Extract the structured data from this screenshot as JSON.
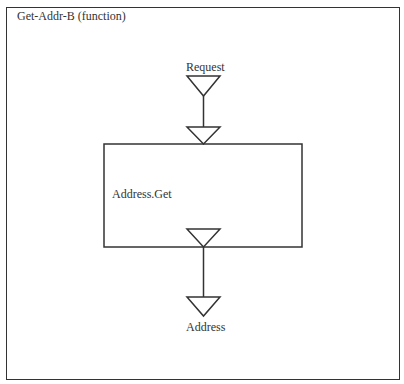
{
  "diagram": {
    "title": "Get-Addr-B (function)",
    "input_label": "Request",
    "process_label": "Address.Get",
    "output_label": "Address",
    "line_color": "#333333"
  }
}
